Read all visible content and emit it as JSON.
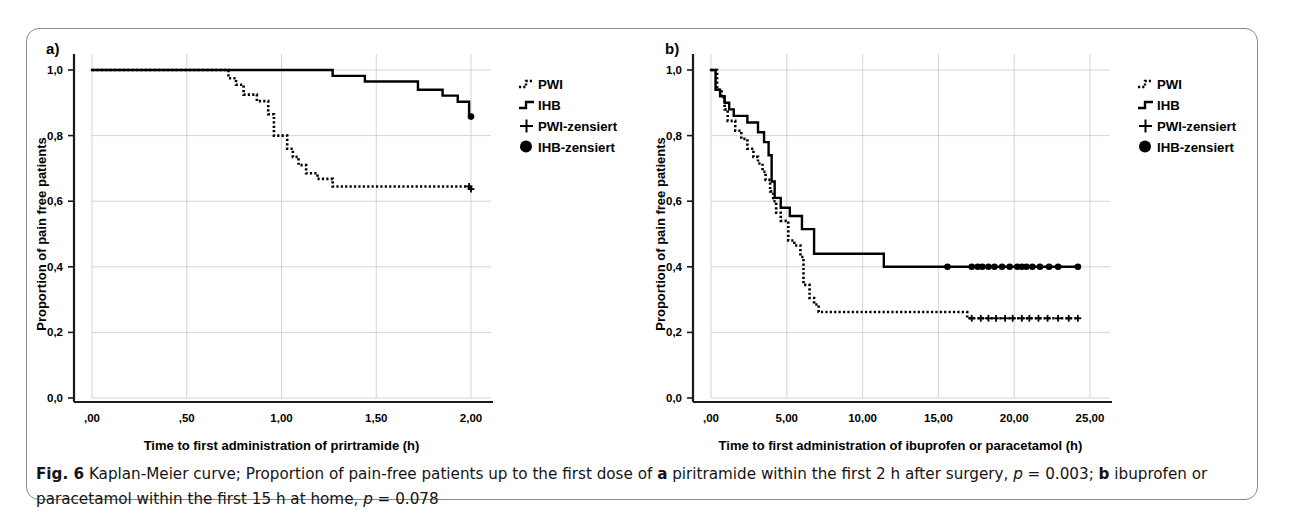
{
  "figure": {
    "panels": [
      {
        "id": "a",
        "label": "a)",
        "xlabel": "Time to first administration of prirtramide (h)",
        "ylabel": "Proportion of pain free patients",
        "xticks": [
          ",00",
          ",50",
          "1,00",
          "1,50",
          "2,00"
        ],
        "yticks": [
          "0,0",
          "0,2",
          "0,4",
          "0,6",
          "0,8",
          "1,0"
        ]
      },
      {
        "id": "b",
        "label": "b)",
        "xlabel": "Time to first administration of ibuprofen or paracetamol (h)",
        "ylabel": "Proportion of pain free patients",
        "xticks": [
          ",00",
          "5,00",
          "10,00",
          "15,00",
          "20,00",
          "25,00"
        ],
        "yticks": [
          "0,0",
          "0,2",
          "0,4",
          "0,6",
          "0,8",
          "1,0"
        ]
      }
    ],
    "legend": {
      "items": [
        {
          "key": "pwi",
          "label": "PWI",
          "marker": "dotted-step"
        },
        {
          "key": "ihb",
          "label": "IHB",
          "marker": "solid-step"
        },
        {
          "key": "pwi_cens",
          "label": "PWI-zensiert",
          "marker": "plus"
        },
        {
          "key": "ihb_cens",
          "label": "IHB-zensiert",
          "marker": "filled-circle"
        }
      ]
    },
    "caption": {
      "fig_number": "Fig. 6",
      "text_1": " Kaplan-Meier curve; Proportion of pain-free patients up to the first dose of ",
      "bold_a": "a",
      "text_2": " piritramide within the first 2 h after surgery, ",
      "ital_p1": "p",
      "text_3": " = 0.003; ",
      "bold_b": "b",
      "text_4": " ibuprofen or paracetamol within the first 15 h at home, ",
      "ital_p2": "p",
      "text_5": " = 0.078"
    },
    "colors": {
      "curve": "#000000",
      "grid": "#c9c9c9",
      "axis": "#1a1a1a",
      "frame": "#8a8a8a",
      "background": "#ffffff"
    }
  },
  "chart_data": [
    {
      "type": "line",
      "panel": "a",
      "title": "Kaplan-Meier: time to first administration of piritramide",
      "xlabel": "Time to first administration of prirtramide (h)",
      "ylabel": "Proportion of pain free patients",
      "xlim": [
        0,
        2.0
      ],
      "ylim": [
        0,
        1.0
      ],
      "xtick_values": [
        0,
        0.5,
        1.0,
        1.5,
        2.0
      ],
      "ytick_values": [
        0,
        0.2,
        0.4,
        0.6,
        0.8,
        1.0
      ],
      "grid": true,
      "legend_position": "right-outside",
      "p_value": 0.003,
      "series": [
        {
          "name": "PWI",
          "style": "dotted",
          "steps": [
            [
              0.0,
              1.0
            ],
            [
              0.72,
              1.0
            ],
            [
              0.72,
              0.975
            ],
            [
              0.76,
              0.975
            ],
            [
              0.76,
              0.955
            ],
            [
              0.8,
              0.955
            ],
            [
              0.8,
              0.925
            ],
            [
              0.87,
              0.925
            ],
            [
              0.87,
              0.905
            ],
            [
              0.93,
              0.905
            ],
            [
              0.93,
              0.865
            ],
            [
              0.96,
              0.865
            ],
            [
              0.96,
              0.8
            ],
            [
              1.03,
              0.8
            ],
            [
              1.03,
              0.76
            ],
            [
              1.06,
              0.76
            ],
            [
              1.06,
              0.735
            ],
            [
              1.09,
              0.735
            ],
            [
              1.09,
              0.71
            ],
            [
              1.13,
              0.71
            ],
            [
              1.13,
              0.685
            ],
            [
              1.19,
              0.685
            ],
            [
              1.19,
              0.668
            ],
            [
              1.27,
              0.668
            ],
            [
              1.27,
              0.645
            ],
            [
              2.0,
              0.645
            ]
          ],
          "censored": [
            [
              1.99,
              0.645
            ],
            [
              2.0,
              0.637
            ]
          ]
        },
        {
          "name": "IHB",
          "style": "solid",
          "steps": [
            [
              0.0,
              1.0
            ],
            [
              1.27,
              1.0
            ],
            [
              1.27,
              0.982
            ],
            [
              1.44,
              0.982
            ],
            [
              1.44,
              0.965
            ],
            [
              1.72,
              0.965
            ],
            [
              1.72,
              0.94
            ],
            [
              1.85,
              0.94
            ],
            [
              1.85,
              0.922
            ],
            [
              1.93,
              0.922
            ],
            [
              1.93,
              0.903
            ],
            [
              1.99,
              0.903
            ],
            [
              1.99,
              0.862
            ]
          ],
          "censored": [
            [
              2.0,
              0.858
            ]
          ]
        }
      ]
    },
    {
      "type": "line",
      "panel": "b",
      "title": "Kaplan-Meier: time to first administration of ibuprofen or paracetamol",
      "xlabel": "Time to first administration of ibuprofen or paracetamol (h)",
      "ylabel": "Proportion of pain free patients",
      "xlim": [
        0,
        25.0
      ],
      "ylim": [
        0,
        1.0
      ],
      "xtick_values": [
        0,
        5,
        10,
        15,
        20,
        25
      ],
      "ytick_values": [
        0,
        0.2,
        0.4,
        0.6,
        0.8,
        1.0
      ],
      "grid": true,
      "legend_position": "right-outside",
      "p_value": 0.078,
      "series": [
        {
          "name": "PWI",
          "style": "dotted",
          "steps": [
            [
              0.0,
              1.0
            ],
            [
              0.4,
              1.0
            ],
            [
              0.4,
              0.94
            ],
            [
              0.7,
              0.94
            ],
            [
              0.7,
              0.915
            ],
            [
              0.9,
              0.915
            ],
            [
              0.9,
              0.88
            ],
            [
              1.1,
              0.88
            ],
            [
              1.1,
              0.845
            ],
            [
              1.6,
              0.845
            ],
            [
              1.6,
              0.815
            ],
            [
              2.0,
              0.815
            ],
            [
              2.0,
              0.79
            ],
            [
              2.4,
              0.79
            ],
            [
              2.4,
              0.76
            ],
            [
              2.8,
              0.76
            ],
            [
              2.8,
              0.735
            ],
            [
              3.1,
              0.735
            ],
            [
              3.1,
              0.715
            ],
            [
              3.4,
              0.715
            ],
            [
              3.4,
              0.69
            ],
            [
              3.6,
              0.69
            ],
            [
              3.6,
              0.665
            ],
            [
              3.9,
              0.665
            ],
            [
              3.9,
              0.63
            ],
            [
              4.1,
              0.63
            ],
            [
              4.1,
              0.6
            ],
            [
              4.3,
              0.6
            ],
            [
              4.3,
              0.565
            ],
            [
              4.6,
              0.565
            ],
            [
              4.6,
              0.54
            ],
            [
              5.1,
              0.54
            ],
            [
              5.1,
              0.48
            ],
            [
              5.5,
              0.48
            ],
            [
              5.5,
              0.465
            ],
            [
              5.9,
              0.465
            ],
            [
              5.9,
              0.43
            ],
            [
              6.1,
              0.43
            ],
            [
              6.1,
              0.345
            ],
            [
              6.5,
              0.345
            ],
            [
              6.5,
              0.305
            ],
            [
              6.8,
              0.305
            ],
            [
              6.8,
              0.285
            ],
            [
              7.1,
              0.285
            ],
            [
              7.1,
              0.262
            ],
            [
              16.9,
              0.262
            ],
            [
              16.9,
              0.243
            ],
            [
              24.2,
              0.243
            ]
          ],
          "censored": [
            [
              17.2,
              0.243
            ],
            [
              17.8,
              0.243
            ],
            [
              18.3,
              0.243
            ],
            [
              18.8,
              0.243
            ],
            [
              19.4,
              0.243
            ],
            [
              19.9,
              0.243
            ],
            [
              20.5,
              0.243
            ],
            [
              21.0,
              0.243
            ],
            [
              21.6,
              0.243
            ],
            [
              22.2,
              0.243
            ],
            [
              22.9,
              0.243
            ],
            [
              23.6,
              0.243
            ],
            [
              24.2,
              0.243
            ]
          ]
        },
        {
          "name": "IHB",
          "style": "solid",
          "steps": [
            [
              0.0,
              1.0
            ],
            [
              0.3,
              1.0
            ],
            [
              0.3,
              0.94
            ],
            [
              0.6,
              0.94
            ],
            [
              0.6,
              0.92
            ],
            [
              0.9,
              0.92
            ],
            [
              0.9,
              0.9
            ],
            [
              1.2,
              0.9
            ],
            [
              1.2,
              0.88
            ],
            [
              1.5,
              0.88
            ],
            [
              1.5,
              0.86
            ],
            [
              2.4,
              0.86
            ],
            [
              2.4,
              0.84
            ],
            [
              3.1,
              0.84
            ],
            [
              3.1,
              0.81
            ],
            [
              3.5,
              0.81
            ],
            [
              3.5,
              0.78
            ],
            [
              3.8,
              0.78
            ],
            [
              3.8,
              0.74
            ],
            [
              4.0,
              0.74
            ],
            [
              4.0,
              0.66
            ],
            [
              4.2,
              0.66
            ],
            [
              4.2,
              0.61
            ],
            [
              4.6,
              0.61
            ],
            [
              4.6,
              0.58
            ],
            [
              5.2,
              0.58
            ],
            [
              5.2,
              0.555
            ],
            [
              6.0,
              0.555
            ],
            [
              6.0,
              0.515
            ],
            [
              6.8,
              0.515
            ],
            [
              6.8,
              0.44
            ],
            [
              11.4,
              0.44
            ],
            [
              11.4,
              0.4
            ],
            [
              24.2,
              0.4
            ]
          ],
          "censored": [
            [
              15.6,
              0.4
            ],
            [
              17.2,
              0.4
            ],
            [
              17.6,
              0.4
            ],
            [
              17.9,
              0.4
            ],
            [
              18.3,
              0.4
            ],
            [
              18.7,
              0.4
            ],
            [
              19.2,
              0.4
            ],
            [
              19.7,
              0.4
            ],
            [
              20.2,
              0.4
            ],
            [
              20.5,
              0.4
            ],
            [
              20.8,
              0.4
            ],
            [
              21.2,
              0.4
            ],
            [
              21.7,
              0.4
            ],
            [
              22.3,
              0.4
            ],
            [
              22.9,
              0.4
            ],
            [
              24.2,
              0.4
            ]
          ]
        }
      ]
    }
  ]
}
